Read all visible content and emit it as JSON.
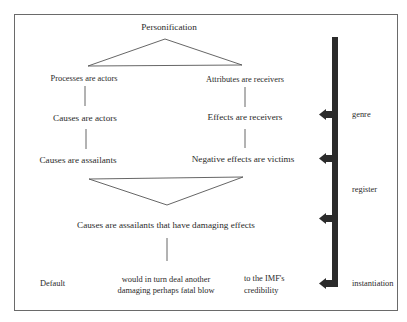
{
  "diagram": {
    "root": "Personification",
    "left_branch": [
      "Processes are actors",
      "Causes are actors",
      "Causes are assailants"
    ],
    "right_branch": [
      "Attributes are receivers",
      "Effects are receivers",
      "Negative effects are victims"
    ],
    "merged": "Causes are assailants that have damaging effects",
    "instantiation_row": {
      "default": "Default",
      "middle_line1": "would in turn deal another",
      "middle_line2": "damaging perhaps fatal blow",
      "right_line1": "to the IMF's",
      "right_line2": "credibility"
    },
    "levels": [
      "genre",
      "register",
      "instantiation"
    ],
    "colors": {
      "line": "#555555",
      "bar": "#2b2b2b",
      "border": "#6a6a6a"
    }
  }
}
